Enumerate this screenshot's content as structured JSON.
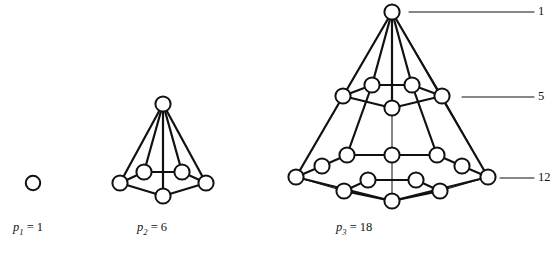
{
  "figure": {
    "background": "#ffffff",
    "stroke_color": "#111111",
    "node_fill": "#ffffff",
    "width": 554,
    "height": 255
  },
  "captions": {
    "first": {
      "symbol": "p",
      "subscript": "1",
      "equals": "=",
      "value": "1",
      "text": "p1 = 1"
    },
    "second": {
      "symbol": "p",
      "subscript": "2",
      "equals": "=",
      "value": "6",
      "text": "p2 = 6"
    },
    "third": {
      "symbol": "p",
      "subscript": "3",
      "equals": "=",
      "value": "18",
      "text": "p3 = 18"
    }
  },
  "leader_labels": [
    {
      "value": "1",
      "layer": "apex",
      "line_x1": 409,
      "line_x2": 534,
      "line_y": 12
    },
    {
      "value": "5",
      "layer": "middle-ring",
      "line_x1": 462,
      "line_x2": 534,
      "line_y": 97
    },
    {
      "value": "12",
      "layer": "bottom-ring",
      "line_x1": 500,
      "line_x2": 534,
      "line_y": 178
    }
  ],
  "chart_data": {
    "type": "diagram",
    "categories": [
      "p1",
      "p2",
      "p3"
    ],
    "values": [
      1,
      6,
      18
    ],
    "layer_counts": [
      1,
      5,
      12
    ],
    "figures": [
      {
        "name": "p1",
        "total_nodes": 1,
        "nodes": [
          {
            "id": "a",
            "x": 33,
            "y": 183
          }
        ],
        "edges": []
      },
      {
        "name": "p2",
        "total_nodes": 6,
        "nodes": [
          {
            "id": "apex",
            "x": 163,
            "y": 104
          },
          {
            "id": "bl",
            "x": 144,
            "y": 172
          },
          {
            "id": "br",
            "x": 182,
            "y": 172
          },
          {
            "id": "l",
            "x": 120,
            "y": 183
          },
          {
            "id": "r",
            "x": 206,
            "y": 183
          },
          {
            "id": "f",
            "x": 163,
            "y": 196
          }
        ],
        "edges": [
          [
            "apex",
            "bl"
          ],
          [
            "apex",
            "br"
          ],
          [
            "apex",
            "l"
          ],
          [
            "apex",
            "r"
          ],
          [
            "apex",
            "f"
          ],
          [
            "bl",
            "br"
          ],
          [
            "bl",
            "l"
          ],
          [
            "br",
            "r"
          ],
          [
            "l",
            "f"
          ],
          [
            "r",
            "f"
          ]
        ]
      },
      {
        "name": "p3",
        "total_nodes": 18,
        "nodes": [
          {
            "id": "apex",
            "x": 392,
            "y": 12
          },
          {
            "id": "m_bl",
            "x": 372,
            "y": 85
          },
          {
            "id": "m_br",
            "x": 412,
            "y": 85
          },
          {
            "id": "m_l",
            "x": 343,
            "y": 96
          },
          {
            "id": "m_r",
            "x": 442,
            "y": 96
          },
          {
            "id": "m_f",
            "x": 392,
            "y": 108
          },
          {
            "id": "b_bl",
            "x": 347,
            "y": 155
          },
          {
            "id": "b_br",
            "x": 437,
            "y": 155
          },
          {
            "id": "b_cl",
            "x": 392,
            "y": 155
          },
          {
            "id": "b_ul",
            "x": 322,
            "y": 166
          },
          {
            "id": "b_ur",
            "x": 462,
            "y": 166
          },
          {
            "id": "b_ll",
            "x": 296,
            "y": 177
          },
          {
            "id": "b_rr",
            "x": 488,
            "y": 177
          },
          {
            "id": "b_il",
            "x": 368,
            "y": 180
          },
          {
            "id": "b_ir",
            "x": 416,
            "y": 180
          },
          {
            "id": "b_fl",
            "x": 344,
            "y": 191
          },
          {
            "id": "b_fr",
            "x": 440,
            "y": 191
          },
          {
            "id": "b_f",
            "x": 392,
            "y": 201
          }
        ],
        "edges": [
          [
            "apex",
            "m_bl"
          ],
          [
            "apex",
            "m_br"
          ],
          [
            "apex",
            "m_l"
          ],
          [
            "apex",
            "m_r"
          ],
          [
            "apex",
            "m_f"
          ],
          [
            "m_bl",
            "m_br"
          ],
          [
            "m_bl",
            "m_l"
          ],
          [
            "m_br",
            "m_r"
          ],
          [
            "m_l",
            "m_f"
          ],
          [
            "m_r",
            "m_f"
          ],
          [
            "apex",
            "b_ll"
          ],
          [
            "apex",
            "b_rr"
          ],
          [
            "m_bl",
            "b_bl"
          ],
          [
            "m_br",
            "b_br"
          ],
          [
            "m_f",
            "b_cl"
          ],
          [
            "m_l",
            "b_ll"
          ],
          [
            "m_r",
            "b_rr"
          ],
          [
            "b_bl",
            "b_cl"
          ],
          [
            "b_cl",
            "b_br"
          ],
          [
            "b_bl",
            "b_ul"
          ],
          [
            "b_ul",
            "b_ll"
          ],
          [
            "b_br",
            "b_ur"
          ],
          [
            "b_ur",
            "b_rr"
          ],
          [
            "b_il",
            "b_ir"
          ],
          [
            "b_il",
            "b_fl"
          ],
          [
            "b_ir",
            "b_fr"
          ],
          [
            "b_fl",
            "b_f"
          ],
          [
            "b_fr",
            "b_f"
          ],
          [
            "b_ll",
            "b_fl"
          ],
          [
            "b_rr",
            "b_fr"
          ],
          [
            "b_ll",
            "b_f"
          ],
          [
            "b_rr",
            "b_f"
          ],
          [
            "b_cl",
            "b_f"
          ]
        ]
      }
    ]
  }
}
